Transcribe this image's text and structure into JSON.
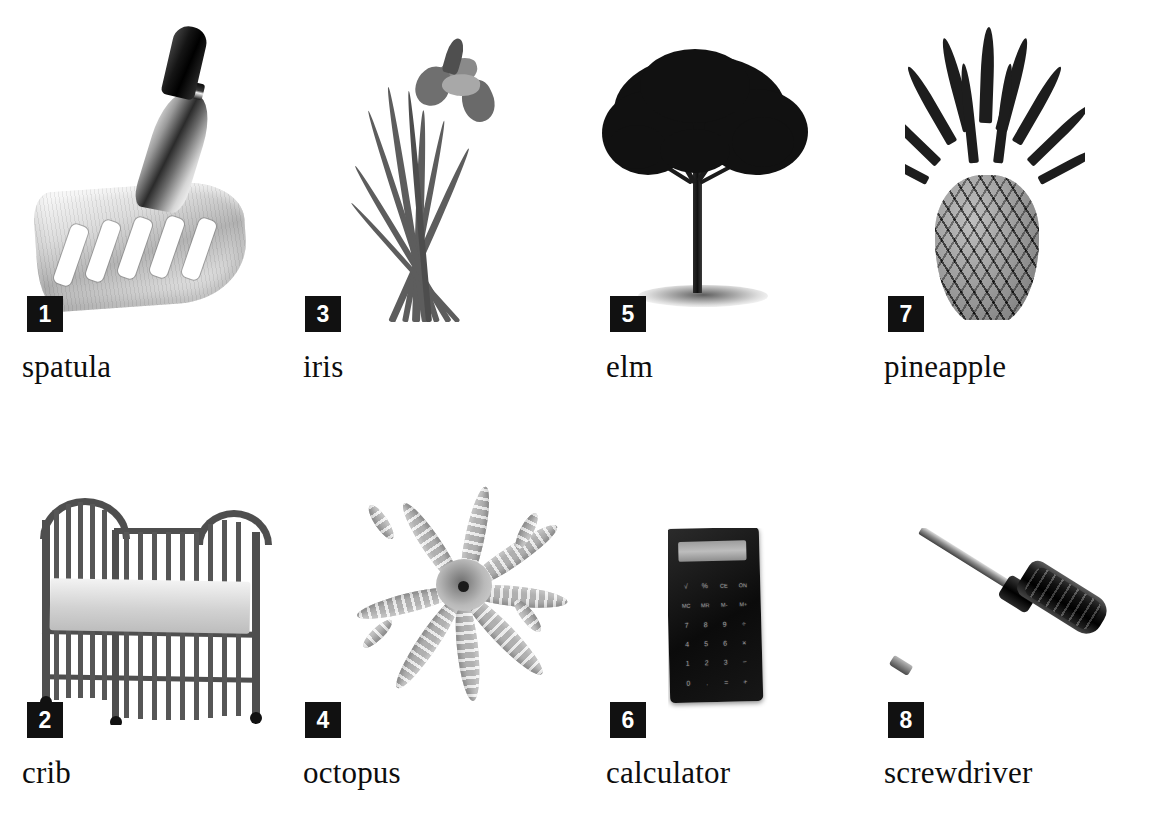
{
  "page": {
    "background": "#ffffff",
    "badge_color": "#111111",
    "badge_text_color": "#ffffff",
    "caption_color": "#0d0d0d",
    "columns": 4,
    "rows": 2
  },
  "items": [
    {
      "number": "1",
      "label": "spatula",
      "icon": "spatula-photo",
      "badge_x": 27,
      "badge_y": 296,
      "caption_x": 22,
      "caption_y": 349,
      "art_x": 18,
      "art_y": 18,
      "art_w": 250,
      "art_h": 300
    },
    {
      "number": "2",
      "label": "crib",
      "icon": "crib-photo",
      "badge_x": 27,
      "badge_y": 702,
      "caption_x": 22,
      "caption_y": 755,
      "art_x": 24,
      "art_y": 480,
      "art_w": 250,
      "art_h": 240
    },
    {
      "number": "3",
      "label": "iris",
      "icon": "iris-photo",
      "badge_x": 305,
      "badge_y": 296,
      "caption_x": 303,
      "caption_y": 349,
      "art_x": 350,
      "art_y": 22,
      "art_w": 230,
      "art_h": 300
    },
    {
      "number": "4",
      "label": "octopus",
      "icon": "octopus-photo",
      "badge_x": 305,
      "badge_y": 702,
      "caption_x": 303,
      "caption_y": 755,
      "art_x": 340,
      "art_y": 455,
      "art_w": 260,
      "art_h": 265
    },
    {
      "number": "5",
      "label": "elm",
      "icon": "elm-tree-photo",
      "badge_x": 610,
      "badge_y": 296,
      "caption_x": 606,
      "caption_y": 349,
      "art_x": 600,
      "art_y": 45,
      "art_w": 280,
      "art_h": 275
    },
    {
      "number": "6",
      "label": "calculator",
      "icon": "calculator-photo",
      "badge_x": 610,
      "badge_y": 702,
      "caption_x": 606,
      "caption_y": 755,
      "art_x": 668,
      "art_y": 528,
      "art_w": 100,
      "art_h": 180
    },
    {
      "number": "7",
      "label": "pineapple",
      "icon": "pineapple-photo",
      "badge_x": 888,
      "badge_y": 296,
      "caption_x": 884,
      "caption_y": 349,
      "art_x": 905,
      "art_y": 25,
      "art_w": 170,
      "art_h": 295
    },
    {
      "number": "8",
      "label": "screwdriver",
      "icon": "screwdriver-photo",
      "badge_x": 888,
      "badge_y": 702,
      "caption_x": 884,
      "caption_y": 755,
      "art_x": 878,
      "art_y": 528,
      "art_w": 250,
      "art_h": 180
    }
  ],
  "calculator_keys": [
    "√",
    "%",
    "CE",
    "ON",
    "MC",
    "MR",
    "M-",
    "M+",
    "7",
    "8",
    "9",
    "÷",
    "4",
    "5",
    "6",
    "×",
    "1",
    "2",
    "3",
    "−",
    "0",
    ".",
    "=",
    "+"
  ]
}
